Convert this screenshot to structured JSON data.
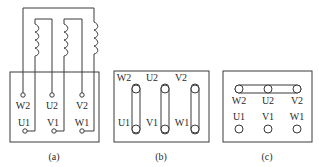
{
  "diagram": {
    "panels": [
      {
        "id": "a",
        "caption": "(a)",
        "top_labels": [
          "W2",
          "U2",
          "V2"
        ],
        "bottom_labels": [
          "U1",
          "V1",
          "W1"
        ],
        "description": "Three motor windings drawn above terminal box, each winding wired to its terminal pair"
      },
      {
        "id": "b",
        "caption": "(b)",
        "top_labels": [
          "W2",
          "U2",
          "V2"
        ],
        "bottom_labels": [
          "U1",
          "V1",
          "W1"
        ],
        "description": "Delta connection: vertical links join W2-U1, U2-V1, V2-W1"
      },
      {
        "id": "c",
        "caption": "(c)",
        "top_labels": [
          "W2",
          "U2",
          "V2"
        ],
        "bottom_labels": [
          "U1",
          "V1",
          "W1"
        ],
        "description": "Star connection: horizontal link joins W2, U2, V2"
      }
    ],
    "colors": {
      "line": "#3a3a3a",
      "text": "#2a2a2a",
      "background": "#ffffff"
    }
  }
}
